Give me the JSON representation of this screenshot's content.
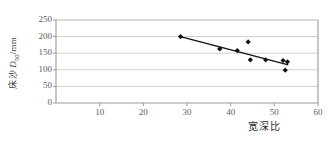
{
  "chart_data": {
    "type": "scatter",
    "title": "",
    "xlabel": "宽深比",
    "ylabel": "床沙 D50/mm",
    "ylabel_prefix": "床沙 ",
    "ylabel_symbol": "D",
    "ylabel_subscript": "50",
    "ylabel_unit": "/mm",
    "xlim": [
      0,
      60
    ],
    "ylim": [
      0,
      250
    ],
    "xticks": [
      10,
      20,
      30,
      40,
      50,
      60
    ],
    "yticks": [
      0,
      50,
      100,
      150,
      200,
      250
    ],
    "grid": "horizontal",
    "legend": "none",
    "marker": "diamond",
    "marker_color": "#111111",
    "points": [
      {
        "x": 28.5,
        "y": 200
      },
      {
        "x": 37.5,
        "y": 163
      },
      {
        "x": 41.5,
        "y": 158
      },
      {
        "x": 44.0,
        "y": 184
      },
      {
        "x": 44.5,
        "y": 130
      },
      {
        "x": 48.0,
        "y": 130
      },
      {
        "x": 52.0,
        "y": 128
      },
      {
        "x": 52.5,
        "y": 99
      },
      {
        "x": 53.0,
        "y": 124
      }
    ],
    "trendline": {
      "x1": 28.5,
      "y1": 200,
      "x2": 53.2,
      "y2": 115,
      "color": "#111111"
    }
  },
  "axes": {
    "x_tick_labels": [
      "10",
      "20",
      "30",
      "40",
      "50",
      "60"
    ],
    "y_tick_labels": [
      "0",
      "50",
      "100",
      "150",
      "200",
      "250"
    ],
    "x_axis_title": "宽深比",
    "y_axis_title": "床沙 D50/mm"
  },
  "colors": {
    "axis": "#9a9a9a",
    "grid": "#c9c9c9",
    "marker": "#111111",
    "trendline": "#111111",
    "tick_text": "#5d5d5d",
    "label_text": "#2f2f2f",
    "background": "#ffffff"
  }
}
